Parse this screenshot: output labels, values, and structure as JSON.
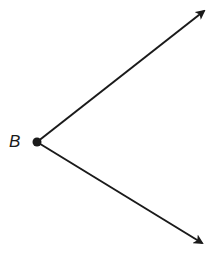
{
  "diagram": {
    "type": "angle",
    "vertex": {
      "label": "B",
      "x": 37,
      "y": 142
    },
    "rays": [
      {
        "name": "upper-ray",
        "end": {
          "x": 205,
          "y": 10
        }
      },
      {
        "name": "lower-ray",
        "end": {
          "x": 203,
          "y": 244
        }
      }
    ],
    "stroke_color": "#1a1a1a",
    "background": "#ffffff"
  }
}
